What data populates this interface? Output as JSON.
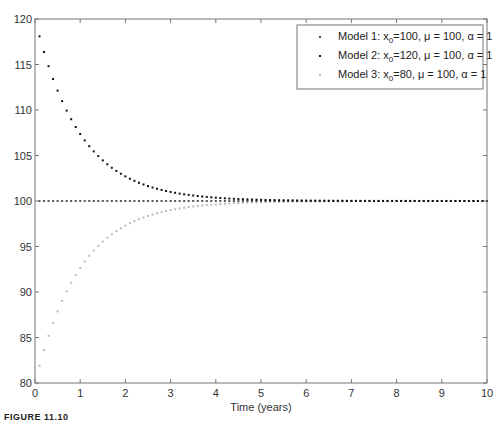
{
  "chart_data": {
    "type": "scatter",
    "title": "",
    "xlabel": "Time (years)",
    "ylabel": "",
    "xlim": [
      0,
      10
    ],
    "ylim": [
      80,
      120
    ],
    "xticks": [
      0,
      1,
      2,
      3,
      4,
      5,
      6,
      7,
      8,
      9,
      10
    ],
    "yticks": [
      80,
      85,
      90,
      95,
      100,
      105,
      110,
      115,
      120
    ],
    "grid": false,
    "legend_position": "upper right",
    "x": {
      "start": 0.1,
      "end": 10,
      "step": 0.1
    },
    "series": [
      {
        "name": "Model 1: x0=100, μ = 100, α = 1",
        "label_main": "Model 1: x",
        "label_sub": "0",
        "label_rest": "=100, μ = 100, α = 1",
        "color": "#555555",
        "x0": 100,
        "mu": 100,
        "alpha": 1,
        "formula": "mu + (x0-mu)*exp(-alpha*t)"
      },
      {
        "name": "Model 2: x0=120, μ = 100, α = 1",
        "label_main": "Model 2: x",
        "label_sub": "0",
        "label_rest": "=120, μ = 100, α = 1",
        "color": "#111111",
        "x0": 120,
        "mu": 100,
        "alpha": 1,
        "formula": "mu + (x0-mu)*exp(-alpha*t)"
      },
      {
        "name": "Model 3: x0=80, μ = 100, α = 1",
        "label_main": "Model 3: x",
        "label_sub": "0",
        "label_rest": "=80, μ = 100, α = 1",
        "color": "#bbbbbb",
        "x0": 80,
        "mu": 100,
        "alpha": 1,
        "formula": "mu + (x0-mu)*exp(-alpha*t)"
      }
    ],
    "sample_values": {
      "t": [
        0.1,
        0.5,
        1,
        2,
        3,
        4,
        5,
        10
      ],
      "model1": [
        100,
        100,
        100,
        100,
        100,
        100,
        100,
        100
      ],
      "model2": [
        118.1,
        112.1,
        107.4,
        102.7,
        101.0,
        100.4,
        100.1,
        100.0
      ],
      "model3": [
        81.9,
        87.9,
        92.6,
        97.3,
        99.0,
        99.6,
        99.9,
        100.0
      ]
    }
  },
  "caption": {
    "prefix": "FIGURE 11.10",
    "rest": ""
  }
}
